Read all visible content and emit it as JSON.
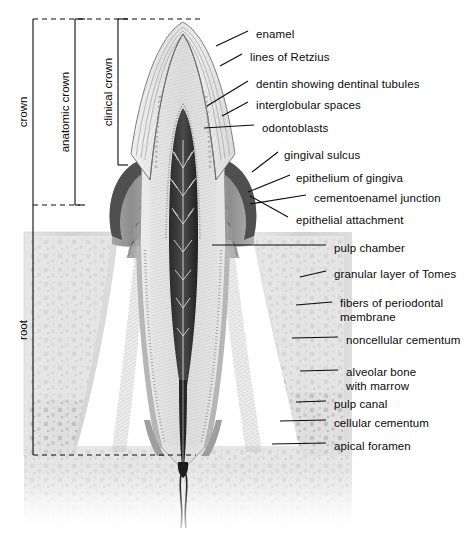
{
  "figure": {
    "background_color": "#ffffff",
    "line_color": "#0a0a0a",
    "text_color": "#0a0a0a"
  },
  "brackets": [
    {
      "id": "crown",
      "label": "crown",
      "x": 33,
      "top": 19,
      "bottom": 205,
      "text_y": 112,
      "tick_len": 0
    },
    {
      "id": "anatomic-crown",
      "label": "anatomic crown",
      "x": 75,
      "top": 19,
      "bottom": 205,
      "text_y": 112,
      "tick_len": 10
    },
    {
      "id": "clinical-crown",
      "label": "clinical crown",
      "x": 118,
      "top": 19,
      "bottom": 165,
      "text_y": 92,
      "tick_len": 10
    },
    {
      "id": "root",
      "label": "root",
      "x": 33,
      "top": 205,
      "bottom": 455,
      "text_y": 330,
      "tick_len": 0
    }
  ],
  "dashed_rules": [
    {
      "id": "crown-top-rule",
      "y": 19,
      "x1": 33,
      "x2": 200
    },
    {
      "id": "cervical-line",
      "y": 205,
      "x1": 33,
      "x2": 80
    },
    {
      "id": "apex-rule",
      "y": 455,
      "x1": 33,
      "x2": 196
    }
  ],
  "labels": [
    {
      "id": "enamel",
      "text": "enamel",
      "x": 256,
      "y": 28,
      "lead": [
        [
          216,
          46
        ],
        [
          248,
          31
        ]
      ]
    },
    {
      "id": "lines-of-retzius",
      "text": "lines of Retzius",
      "x": 250,
      "y": 51,
      "lead": [
        [
          220,
          66
        ],
        [
          242,
          54
        ]
      ]
    },
    {
      "id": "dentin-tubules",
      "text": "dentin showing dentinal tubules",
      "x": 256,
      "y": 78,
      "lead": [
        [
          207,
          106
        ],
        [
          248,
          81
        ]
      ]
    },
    {
      "id": "interglobular-spaces",
      "text": "interglobular spaces",
      "x": 256,
      "y": 99,
      "lead": [
        [
          222,
          116
        ],
        [
          248,
          102
        ]
      ]
    },
    {
      "id": "odontoblasts",
      "text": "odontoblasts",
      "x": 262,
      "y": 122,
      "lead": [
        [
          204,
          128
        ],
        [
          254,
          125
        ]
      ]
    },
    {
      "id": "gingival-sulcus",
      "text": "gingival sulcus",
      "x": 284,
      "y": 149,
      "lead": [
        [
          252,
          172
        ],
        [
          278,
          152
        ]
      ]
    },
    {
      "id": "epithelium-of-gingiva",
      "text": "epithelium of gingiva",
      "x": 296,
      "y": 172,
      "lead": [
        [
          248,
          192
        ],
        [
          290,
          175
        ]
      ]
    },
    {
      "id": "cementoenamel-junction",
      "text": "cementoenamel junction",
      "x": 314,
      "y": 192,
      "lead": [
        [
          250,
          204
        ],
        [
          306,
          195
        ]
      ]
    },
    {
      "id": "epithelial-attachment",
      "text": "epithelial attachment",
      "x": 296,
      "y": 214,
      "lead": [
        [
          250,
          196
        ],
        [
          288,
          217
        ]
      ]
    },
    {
      "id": "pulp-chamber",
      "text": "pulp chamber",
      "x": 334,
      "y": 242,
      "lead": [
        [
          212,
          245
        ],
        [
          326,
          245
        ]
      ]
    },
    {
      "id": "granular-layer-of-tomes",
      "text": "granular layer of Tomes",
      "x": 334,
      "y": 268,
      "lead": [
        [
          300,
          277
        ],
        [
          326,
          271
        ]
      ]
    },
    {
      "id": "fibers-periodontal-1",
      "text": "fibers of periodontal",
      "x": 340,
      "y": 297,
      "lead": [
        [
          296,
          305
        ],
        [
          332,
          302
        ]
      ]
    },
    {
      "id": "fibers-periodontal-2",
      "text": "membrane",
      "x": 340,
      "y": 311,
      "lead": null
    },
    {
      "id": "noncellular-cementum",
      "text": "noncellular cementum",
      "x": 346,
      "y": 334,
      "lead": [
        [
          292,
          338
        ],
        [
          338,
          337
        ]
      ]
    },
    {
      "id": "alveolar-bone-1",
      "text": "alveolar bone",
      "x": 346,
      "y": 366,
      "lead": [
        [
          300,
          371
        ],
        [
          338,
          370
        ]
      ]
    },
    {
      "id": "alveolar-bone-2",
      "text": "with marrow",
      "x": 346,
      "y": 380,
      "lead": null
    },
    {
      "id": "pulp-canal",
      "text": "pulp canal",
      "x": 334,
      "y": 398,
      "lead": [
        [
          296,
          402
        ],
        [
          326,
          401
        ]
      ]
    },
    {
      "id": "cellular-cementum",
      "text": "cellular cementum",
      "x": 334,
      "y": 417,
      "lead": [
        [
          280,
          421
        ],
        [
          326,
          420
        ]
      ]
    },
    {
      "id": "apical-foramen",
      "text": "apical foramen",
      "x": 334,
      "y": 440,
      "lead": [
        [
          272,
          444
        ],
        [
          326,
          443
        ]
      ]
    }
  ],
  "structures": {
    "enamel": "outer crown cap, pale hatched",
    "dentin": "bulk of crown and root, fine tubule striation",
    "pulp_chamber": "dark central cavity with branching vessels",
    "pulp_canal": "narrow dark channel through root",
    "gingiva": "dark soft tissue collar at cervix",
    "alveolar_bone": "trabecular bone with marrow spaces",
    "cementum": "thin layer over root dentin",
    "periodontal_membrane": "fibrous band between root and bone"
  }
}
